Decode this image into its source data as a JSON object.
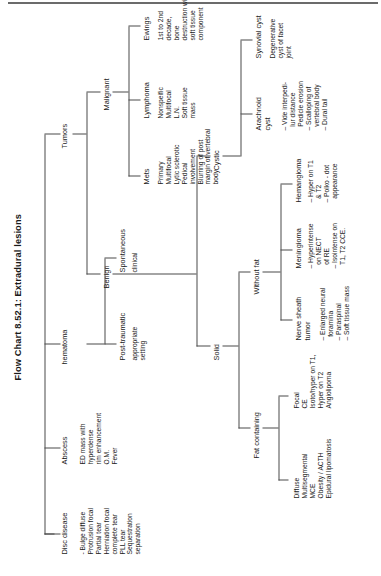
{
  "title": "Flow Chart 8.52.1: Extradural lesions",
  "root": "Extradural lesions",
  "nodes": {
    "disc_disease": "Disc disease",
    "abscess": "Abscess",
    "hematoma": "hematoma",
    "tumors": "Tumors",
    "benign": "Benign",
    "malignant": "Malignant",
    "mets": "Mets",
    "lymphoma": "Lymphoma",
    "ewings": "Ewings",
    "solid": "Solid",
    "cystic": "Cystic",
    "fat_containing": "Fat containing",
    "without_fat": "Without fat",
    "nerve_sheath_tumor": "Nerve sheath\ntumor",
    "meningioma": "Meningioma",
    "hemangioma": "Hemangioma",
    "arachnoid_cyst": "Arachnoid\ncyst",
    "synovial_cyst": "Synovial cyst",
    "post_traumatic": "Post-traumatic",
    "spontaneous": "Spontaneous"
  },
  "details": {
    "disc_disease": "- Bulge diffuse\nProtrusion focal\nPartial tear\nHerniation focal\ncomplete tear\nPLL tear\nSequestration\nseparation",
    "abscess": "ED mass with\nhyperdense\nrim enhancement\nO.M.\nFever",
    "post_traumatic": "appropriate\nsetting",
    "spontaneous": "clinical",
    "mets": "Primary\nMultifocal\nLytic sclerotic\nPedical\ninvolvement\nBlurring of post\nmargin of vertebral\nbody",
    "lymphoma": "Nonspeific\nMultifocal\nL.N.\nSoft tissue\nmass",
    "ewings": "1st to 2nd\ndecade,\nbone\ndestruction with\nsoft tissue\ncomponent",
    "fat_focal": "Focal\nCE\nIsoto/hyper on T1,\nHyper on T2\nAngiolipoma",
    "fat_diffuse": "Diffuse\nMultisegmental\nMCE\nObesity / ACTH\nEpidural lipomatosis",
    "nerve_sheath_tumor": "– Enlarged neural\n  foramina\n– Paraspinal\n– Soft tissue mass",
    "meningioma": "– Hyperintense\n  on NECT\n  of RE\n– Isointense on\n  T1, T2 CCE.",
    "hemangioma": "– Hyper on T1\n  & T2\n– Polko - dot\n  appearance",
    "arachnoid_cyst": "– Vide interpedi-\n  lur distance\n  Pedicle erosion\n– Scalloping of\n  vertebral body\n– Dural tail",
    "synovial_cyst": "Degenerative\ncyst of facet\njoint"
  },
  "colors": {
    "ink": "#1a1a1a",
    "line": "#4a4a4a",
    "rule": "#6b6b6b",
    "bg": "#ffffff"
  }
}
